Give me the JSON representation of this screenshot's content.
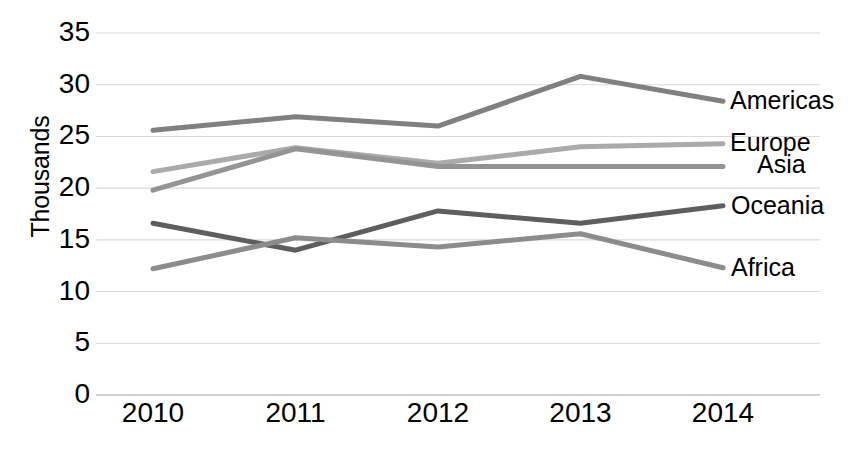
{
  "chart_data": {
    "type": "line",
    "title": "",
    "subtitle": "",
    "xlabel": "",
    "ylabel": "Thousands",
    "categories": [
      "2010",
      "2011",
      "2012",
      "2013",
      "2014"
    ],
    "x": [
      2010,
      2011,
      2012,
      2013,
      2014
    ],
    "ylim": [
      0,
      35
    ],
    "y_ticks": [
      "0",
      "5",
      "10",
      "15",
      "20",
      "25",
      "30",
      "35"
    ],
    "y_tick_values": [
      0,
      5,
      10,
      15,
      20,
      25,
      30,
      35
    ],
    "grid": true,
    "grid_axis": "y",
    "legend_position": "right-end-of-line",
    "series": [
      {
        "name": "Americas",
        "values": [
          25.6,
          26.9,
          26.0,
          30.8,
          28.4
        ],
        "color": "#808080"
      },
      {
        "name": "Europe",
        "values": [
          21.6,
          23.9,
          22.4,
          24.0,
          24.3
        ],
        "color": "#aaaaaa"
      },
      {
        "name": "Asia",
        "values": [
          19.8,
          23.8,
          22.1,
          22.1,
          22.1
        ],
        "color": "#949494"
      },
      {
        "name": "Oceania",
        "values": [
          16.6,
          14.0,
          17.8,
          16.6,
          18.3
        ],
        "color": "#5e5e5e"
      },
      {
        "name": "Africa",
        "values": [
          12.2,
          15.2,
          14.3,
          15.6,
          12.3
        ],
        "color": "#8c8c8c"
      }
    ]
  },
  "axis": {
    "y_title": "Thousands"
  },
  "colors": {
    "background": "#ffffff",
    "text": "#000000",
    "gridline": "#d9d9d9",
    "axisline": "#bfbfbf"
  }
}
